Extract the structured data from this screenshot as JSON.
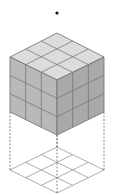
{
  "diagram": {
    "type": "isometric-cube",
    "grid_size": 3,
    "colors": {
      "background": "#ffffff",
      "top_face": "#dcdcdc",
      "left_face": "#b9b9b9",
      "right_face": "#a9a9a9",
      "cube_lines": "#6e6e6e",
      "base_lines": "#8a8a8a",
      "dashed_lines": "#555555",
      "dot": "#111111"
    },
    "points": {
      "dot": [
        57,
        13
      ],
      "top_back": [
        57,
        33
      ],
      "top_left": [
        10,
        57
      ],
      "top_right": [
        104,
        57
      ],
      "top_front": [
        57,
        80
      ],
      "bottom_left": [
        10,
        112
      ],
      "bottom_right": [
        104,
        112
      ],
      "bottom_front": [
        57,
        135
      ],
      "base_back": [
        57,
        147
      ],
      "base_left": [
        10,
        170
      ],
      "base_right": [
        104,
        170
      ],
      "base_front": [
        57,
        193
      ]
    }
  }
}
